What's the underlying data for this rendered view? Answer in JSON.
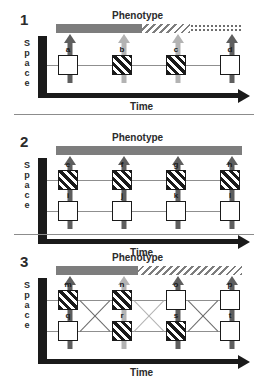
{
  "figure": {
    "title_terms": {
      "phenotype": "Phenotype",
      "time": "Time",
      "space_letters": [
        "S",
        "p",
        "a",
        "c",
        "e"
      ]
    },
    "colors": {
      "solid_gray": "#7d7d7d",
      "dark_arrow": "#5e5e5e",
      "light_arrow": "#b3b3b3",
      "black": "#1a1a1a",
      "lineage_line": "#8f8f8f",
      "separator": "#8c8c8c"
    }
  },
  "panels": [
    {
      "number": "1",
      "phenotype_label": "Phenotype",
      "space_label": [
        "S",
        "p",
        "a",
        "c",
        "e"
      ],
      "time_label": "Time",
      "phenotype_segments": [
        {
          "style": "solid",
          "width_pct": 46
        },
        {
          "style": "hatch",
          "width_pct": 26
        },
        {
          "style": "dot",
          "width_pct": 28
        }
      ],
      "rows": [
        {
          "boxes": [
            {
              "letter": "a",
              "fill": "white"
            },
            {
              "letter": "b",
              "fill": "hatch"
            },
            {
              "letter": "c",
              "fill": "hatch"
            },
            {
              "letter": "d",
              "fill": "white"
            }
          ]
        }
      ],
      "arrows": [
        {
          "tone": "dark"
        },
        {
          "tone": "light"
        },
        {
          "tone": "light"
        },
        {
          "tone": "dark"
        }
      ],
      "crossings": []
    },
    {
      "number": "2",
      "phenotype_label": "Phenotype",
      "space_label": [
        "S",
        "p",
        "a",
        "c",
        "e"
      ],
      "time_label": "Time",
      "phenotype_segments": [
        {
          "style": "solid",
          "width_pct": 100
        }
      ],
      "rows": [
        {
          "boxes": [
            {
              "letter": "e",
              "fill": "hatch"
            },
            {
              "letter": "f",
              "fill": "hatch"
            },
            {
              "letter": "g",
              "fill": "hatch"
            },
            {
              "letter": "h",
              "fill": "hatch"
            }
          ]
        },
        {
          "boxes": [
            {
              "letter": "i",
              "fill": "white"
            },
            {
              "letter": "j",
              "fill": "white"
            },
            {
              "letter": "k",
              "fill": "white"
            },
            {
              "letter": "l",
              "fill": "white"
            }
          ]
        }
      ],
      "arrows": [
        {
          "tone": "dark"
        },
        {
          "tone": "dark"
        },
        {
          "tone": "dark"
        },
        {
          "tone": "dark"
        }
      ],
      "crossings": []
    },
    {
      "number": "3",
      "phenotype_label": "Phenotype",
      "space_label": [
        "S",
        "p",
        "a",
        "c",
        "e"
      ],
      "time_label": "Time",
      "phenotype_segments": [
        {
          "style": "solid",
          "width_pct": 44
        },
        {
          "style": "hatch",
          "width_pct": 56
        }
      ],
      "rows": [
        {
          "boxes": [
            {
              "letter": "m",
              "fill": "hatch"
            },
            {
              "letter": "n",
              "fill": "hatch"
            },
            {
              "letter": "o",
              "fill": "white"
            },
            {
              "letter": "p",
              "fill": "white"
            }
          ]
        },
        {
          "boxes": [
            {
              "letter": "q",
              "fill": "white"
            },
            {
              "letter": "r",
              "fill": "hatch"
            },
            {
              "letter": "s",
              "fill": "hatch"
            },
            {
              "letter": "t",
              "fill": "white"
            }
          ]
        }
      ],
      "arrows": [
        {
          "tone": "dark"
        },
        {
          "tone": "light"
        },
        {
          "tone": "dark"
        },
        {
          "tone": "dark"
        }
      ],
      "crossings": [
        {
          "from_col": 0,
          "to_col": 1,
          "direction": "down",
          "tone": "dark"
        },
        {
          "from_col": 0,
          "to_col": 1,
          "direction": "up",
          "tone": "dark"
        },
        {
          "from_col": 1,
          "to_col": 2,
          "direction": "down",
          "tone": "light"
        },
        {
          "from_col": 1,
          "to_col": 2,
          "direction": "up",
          "tone": "light"
        },
        {
          "from_col": 2,
          "to_col": 3,
          "direction": "down",
          "tone": "dark"
        },
        {
          "from_col": 2,
          "to_col": 3,
          "direction": "up",
          "tone": "dark"
        }
      ]
    }
  ]
}
